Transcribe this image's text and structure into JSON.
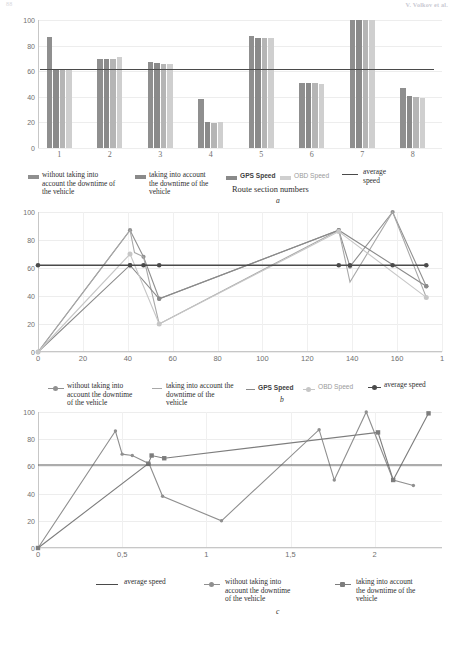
{
  "running_head": {
    "page_number": "88",
    "authors": "V. Volkov et al."
  },
  "colors": {
    "series_gps_without": "#8f8f8f",
    "series_gps": "#8a8a8a",
    "series_obd_without": "#b5b5b5",
    "series_obd": "#cfcfcf",
    "average_speed": "#4a4a4a",
    "grid": "#ededed",
    "axis": "#c7c7c7",
    "text": "#3a3a3a"
  },
  "figures": [
    {
      "id": "a",
      "label": "a",
      "axis_title": "Route section numbers",
      "chart_data": {
        "type": "bar",
        "title": "",
        "xlabel": "Route section numbers",
        "ylabel": "",
        "categories": [
          "1",
          "2",
          "3",
          "4",
          "5",
          "6",
          "7",
          "8"
        ],
        "ylim": [
          0,
          100
        ],
        "yticks": [
          0,
          20,
          40,
          60,
          80,
          100
        ],
        "grid": true,
        "legend_position": "bottom",
        "series": [
          {
            "name": "without taking into account the downtime of the vehicle",
            "values": [
              87,
              69.5,
              67,
              38,
              87.5,
              51,
              100,
              47
            ]
          },
          {
            "name": "taking into account the downtime of the vehicle",
            "values": [
              62,
              69.5,
              66.5,
              20,
              86,
              51,
              100,
              40.5
            ]
          },
          {
            "name": "GPS Speed",
            "values": [
              62,
              69.5,
              66,
              19.5,
              86,
              50.5,
              100,
              39.5
            ]
          },
          {
            "name": "OBD Speed",
            "values": [
              62,
              71,
              66,
              20,
              86,
              50,
              100,
              39
            ]
          }
        ],
        "average_speed_line": 62
      },
      "legend": [
        {
          "marker": "bar",
          "color": "#8f8f8f",
          "label": "without taking into account the downtime of the vehicle",
          "style": "serif"
        },
        {
          "marker": "bar",
          "color": "#8a8a8a",
          "label": "taking into account the downtime of the vehicle",
          "style": "serif"
        },
        {
          "marker": "bar",
          "color": "#8a8a8a",
          "label": "GPS Speed",
          "style": "sans-bold"
        },
        {
          "marker": "bar",
          "color": "#cfcfcf",
          "label": "OBD Speed",
          "style": "sans-light"
        },
        {
          "marker": "line",
          "color": "#4a4a4a",
          "label": "average speed",
          "style": "serif"
        }
      ]
    },
    {
      "id": "b",
      "label": "b",
      "axis_title": "",
      "chart_data": {
        "type": "line",
        "title": "",
        "xlabel": "",
        "ylabel": "",
        "xlim": [
          0,
          180
        ],
        "ylim": [
          0,
          100
        ],
        "xticks": [
          0,
          20,
          40,
          60,
          80,
          100,
          120,
          140,
          160,
          180
        ],
        "xtick_labels": [
          "0",
          "20",
          "40",
          "60",
          "80",
          "100",
          "120",
          "140",
          "160",
          "1"
        ],
        "yticks": [
          0,
          20,
          40,
          60,
          80,
          100
        ],
        "grid": true,
        "legend_position": "bottom",
        "series": [
          {
            "name": "without taking into account the downtime of the vehicle",
            "color": "#909090",
            "x": [
              0,
              41,
              47,
              54,
              134,
              139,
              158,
              173
            ],
            "y": [
              0,
              87,
              68,
              38,
              87,
              61,
              100,
              47
            ]
          },
          {
            "name": "taking into account the downtime of the vehicle",
            "color": "#a8a8a8",
            "x": [
              0,
              41,
              43,
              47,
              54,
              134,
              139,
              158,
              173
            ],
            "y": [
              0,
              87,
              71,
              68,
              20,
              87,
              50,
              100,
              39
            ]
          },
          {
            "name": "GPS Speed",
            "color": "#8a8a8a",
            "x": [
              0,
              41,
              54,
              134,
              173
            ],
            "y": [
              0,
              62,
              38,
              87,
              47
            ]
          },
          {
            "name": "OBD Speed",
            "color": "#c6c6c6",
            "x": [
              0,
              41,
              54,
              134,
              173
            ],
            "y": [
              0,
              70,
              20,
              86,
              39
            ]
          },
          {
            "name": "average speed",
            "color": "#4a4a4a",
            "x": [
              0,
              41,
              47,
              54,
              134,
              139,
              158,
              173
            ],
            "y": [
              62,
              62,
              62,
              62,
              62,
              62,
              62,
              62
            ]
          }
        ]
      },
      "legend": [
        {
          "marker": "line-marker",
          "color": "#909090",
          "label": "without taking into account the downtime of the vehicle",
          "style": "serif"
        },
        {
          "marker": "line",
          "color": "#a8a8a8",
          "label": "taking into account the downtime of the vehicle",
          "style": "serif"
        },
        {
          "marker": "line",
          "color": "#8a8a8a",
          "label": "GPS Speed",
          "style": "sans-bold"
        },
        {
          "marker": "line-marker",
          "color": "#c6c6c6",
          "label": "OBD Speed",
          "style": "sans-light"
        },
        {
          "marker": "line-marker",
          "color": "#4a4a4a",
          "label": "average speed",
          "style": "serif"
        }
      ]
    },
    {
      "id": "c",
      "label": "c",
      "axis_title": "",
      "chart_data": {
        "type": "line",
        "title": "",
        "xlabel": "",
        "ylabel": "",
        "xlim": [
          0,
          2.4
        ],
        "ylim": [
          0,
          100
        ],
        "xticks": [
          0,
          0.5,
          1,
          1.5,
          2
        ],
        "xtick_labels": [
          "0",
          "0,5",
          "1",
          "1,5",
          "2"
        ],
        "yticks": [
          0,
          20,
          40,
          60,
          80,
          100
        ],
        "grid": true,
        "legend_position": "bottom",
        "series": [
          {
            "name": "without taking into account the downtime of the vehicle",
            "color": "#8f8f8f",
            "x": [
              0,
              0.46,
              0.5,
              0.56,
              0.66,
              0.74,
              1.09,
              1.67,
              1.76,
              1.95,
              2.11,
              2.23
            ],
            "y": [
              0,
              86,
              69,
              68,
              62,
              38,
              20,
              87,
              50,
              100,
              50,
              46
            ]
          },
          {
            "name": "taking into account the downtime of the vehicle",
            "color": "#7d7d7d",
            "x": [
              0,
              0.655,
              0.675,
              0.75,
              2.02,
              2.11,
              2.32
            ],
            "y": [
              0,
              62,
              68,
              66,
              85,
              50,
              99
            ]
          },
          {
            "name": "average speed",
            "color": "#5a5a5a",
            "x": [
              0,
              2.4
            ],
            "y": [
              61,
              61
            ]
          }
        ]
      },
      "legend": [
        {
          "marker": "line",
          "color": "#4a4a4a",
          "label": "average speed",
          "style": "serif"
        },
        {
          "marker": "line-marker",
          "color": "#8f8f8f",
          "label": "without taking into account the downtime of the vehicle",
          "style": "serif"
        },
        {
          "marker": "line-marker-square",
          "color": "#7d7d7d",
          "label": "taking into account the downtime of the vehicle",
          "style": "serif"
        }
      ]
    }
  ]
}
